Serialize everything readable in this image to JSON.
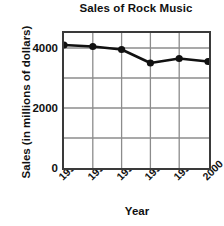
{
  "chart_data": {
    "type": "line",
    "title": "Sales of Rock Music",
    "xlabel": "Year",
    "ylabel": "Sales (in millions of dollars)",
    "categories": [
      "1995",
      "1996",
      "1997",
      "1998",
      "1999",
      "2000"
    ],
    "values": [
      4100,
      4050,
      3950,
      3500,
      3650,
      3550
    ],
    "series": [
      {
        "name": "Sales",
        "values": [
          4100,
          4050,
          3950,
          3500,
          3650,
          3550
        ]
      }
    ],
    "ylim": [
      0,
      4500
    ],
    "yticks": [
      0,
      1000,
      2000,
      3000,
      4000
    ],
    "ytick_labels": [
      "0",
      "",
      "2000",
      "",
      "4000"
    ],
    "grid": true,
    "legend": false,
    "marker": "circle",
    "line_color": "#111111",
    "marker_color": "#111111",
    "grid_color": "#8c8c8c",
    "axis_color": "#3a3a3a",
    "background": "#ffffff"
  }
}
